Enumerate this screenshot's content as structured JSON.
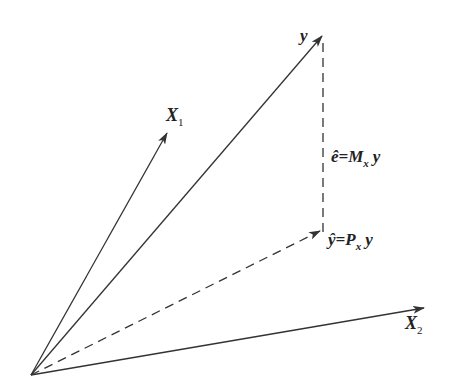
{
  "diagram": {
    "title": "",
    "origin": {
      "x": 31,
      "y": 375
    },
    "vectors": [
      {
        "id": "X1",
        "label": "X",
        "subscript": "1",
        "tip": {
          "x": 167,
          "y": 133
        },
        "style": "solid"
      },
      {
        "id": "y",
        "label": "y",
        "subscript": "",
        "tip": {
          "x": 322,
          "y": 35
        },
        "style": "solid"
      },
      {
        "id": "yhat",
        "label": "ŷ=P",
        "subscript": "x",
        "suffix": " y",
        "tip": {
          "x": 320,
          "y": 230
        },
        "style": "dashed"
      },
      {
        "id": "X2",
        "label": "X",
        "subscript": "2",
        "tip": {
          "x": 424,
          "y": 308
        },
        "style": "solid"
      }
    ],
    "residual": {
      "label": "ê=M",
      "subscript": "x",
      "suffix": " y",
      "from": {
        "x": 323,
        "y": 232
      },
      "to": {
        "x": 323,
        "y": 38
      },
      "style": "dashed"
    },
    "labels": {
      "y": "y",
      "X1": "X",
      "X1_sub": "1",
      "X2": "X",
      "X2_sub": "2",
      "e_hat": "ê=M",
      "e_hat_sub": "x",
      "e_hat_suffix": "y",
      "y_hat": "ŷ=P",
      "y_hat_sub": "x",
      "y_hat_suffix": "y"
    },
    "colors": {
      "stroke": "#333333",
      "text": "#222222",
      "background": "#ffffff"
    }
  }
}
